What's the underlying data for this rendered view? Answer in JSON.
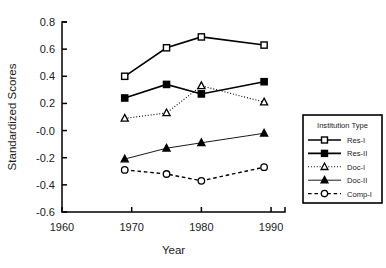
{
  "chart_data": {
    "type": "line",
    "title": "",
    "xlabel": "Year",
    "ylabel": "Standardized Scores",
    "xlim": [
      1960,
      1992
    ],
    "ylim": [
      -0.6,
      0.8
    ],
    "xticks": [
      1960,
      1970,
      1980,
      1990
    ],
    "xtick_labels": [
      "1960",
      "1970",
      "1980",
      "1990"
    ],
    "yticks": [
      0.8,
      0.6,
      0.4,
      0.2,
      -0.0,
      -0.2,
      -0.4,
      -0.6
    ],
    "ytick_labels": [
      "0.8",
      "0.6",
      "0.4",
      "0.2",
      "-0.0",
      "-0.2",
      "-0.4",
      "-0.6"
    ],
    "grid": false,
    "legend_position": "right-middle",
    "legend_title": "Institution Type",
    "x": [
      1969,
      1975,
      1980,
      1989
    ],
    "series": [
      {
        "name": "Res-I",
        "values": [
          0.4,
          0.61,
          0.69,
          0.63
        ],
        "marker": "open-square",
        "linestyle": "solid",
        "color": "#000000",
        "linewidth": 1.6
      },
      {
        "name": "Res-II",
        "values": [
          0.24,
          0.34,
          0.27,
          0.36
        ],
        "marker": "filled-square",
        "linestyle": "solid",
        "color": "#000000",
        "linewidth": 1.6
      },
      {
        "name": "Doc-I",
        "values": [
          0.09,
          0.13,
          0.33,
          0.21
        ],
        "marker": "open-triangle",
        "linestyle": "dotted",
        "color": "#000000",
        "linewidth": 1.1
      },
      {
        "name": "Doc-II",
        "values": [
          -0.21,
          -0.13,
          -0.09,
          -0.02
        ],
        "marker": "filled-triangle",
        "linestyle": "solid",
        "color": "#000000",
        "linewidth": 0.9
      },
      {
        "name": "Comp-I",
        "values": [
          -0.29,
          -0.32,
          -0.37,
          -0.27
        ],
        "marker": "open-circle",
        "linestyle": "dashed",
        "color": "#000000",
        "linewidth": 1.4
      }
    ]
  }
}
